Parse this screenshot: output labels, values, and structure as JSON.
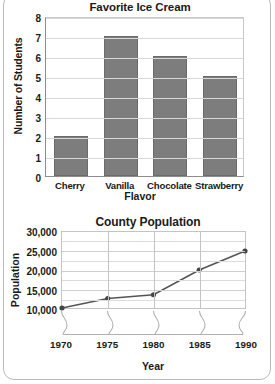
{
  "chart_data": [
    {
      "type": "bar",
      "title": "Favorite Ice Cream",
      "xlabel": "Flavor",
      "ylabel": "Number of Students",
      "categories": [
        "Cherry",
        "Vanilla",
        "Chocolate",
        "Strawberry"
      ],
      "values": [
        2,
        7,
        6,
        5
      ],
      "ylim": [
        0,
        8
      ],
      "yticks": [
        "0",
        "1",
        "2",
        "3",
        "4",
        "5",
        "6",
        "7",
        "8"
      ],
      "grid": "horizontal",
      "legend": "none",
      "bar_color": "#7d7d7d"
    },
    {
      "type": "line",
      "title": "County Population",
      "xlabel": "Year",
      "ylabel": "Population",
      "x": [
        "1970",
        "1975",
        "1980",
        "1985",
        "1990"
      ],
      "values": [
        10000,
        12500,
        13500,
        20000,
        25000
      ],
      "ylim": [
        10000,
        30000
      ],
      "yticks": [
        "10,000",
        "15,000",
        "20,000",
        "25,000",
        "30,000"
      ],
      "minor_y_step": 2500,
      "grid": "both",
      "legend": "none",
      "axis_break": "y-axis broken below 10,000 (squiggle marks on x-axis)",
      "line_color": "#555555",
      "marker": "circle"
    }
  ],
  "bar_chart": {
    "title": "Favorite Ice Cream",
    "ylabel": "Number of Students",
    "xlabel": "Flavor",
    "yticks": [
      "8",
      "7",
      "6",
      "5",
      "4",
      "3",
      "2",
      "1",
      "0"
    ],
    "categories": [
      {
        "label": "Cherry",
        "value": 2
      },
      {
        "label": "Vanilla",
        "value": 7
      },
      {
        "label": "Chocolate",
        "value": 6
      },
      {
        "label": "Strawberry",
        "value": 5
      }
    ]
  },
  "line_chart": {
    "title": "County Population",
    "ylabel": "Population",
    "xlabel": "Year",
    "yticks": [
      "30,000",
      "25,000",
      "20,000",
      "15,000",
      "10,000"
    ],
    "points": [
      {
        "x": "1970",
        "y": 10000
      },
      {
        "x": "1975",
        "y": 12500
      },
      {
        "x": "1980",
        "y": 13500
      },
      {
        "x": "1985",
        "y": 20000
      },
      {
        "x": "1990",
        "y": 25000
      }
    ]
  }
}
